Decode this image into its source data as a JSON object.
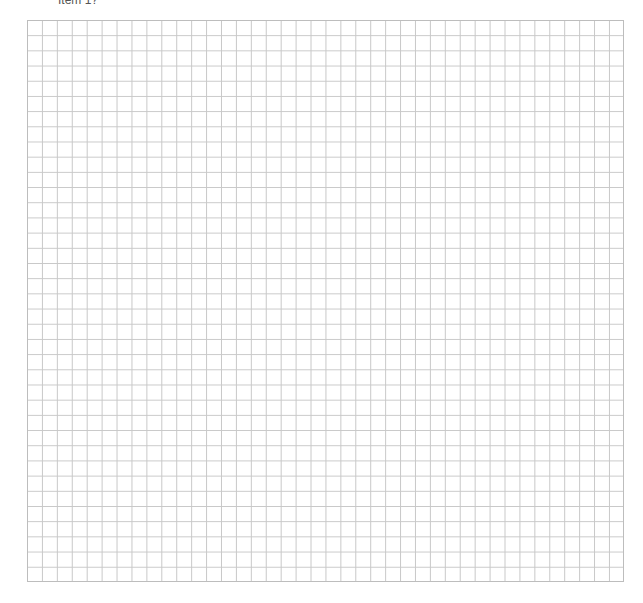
{
  "header": {
    "label": "Item 1?"
  },
  "grid": {
    "columns": 40,
    "rows": 37,
    "line_color": "#c8c8c8",
    "background": "#ffffff"
  }
}
